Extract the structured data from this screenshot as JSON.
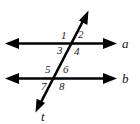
{
  "figure": {
    "type": "geometry-diagram",
    "background_color": "#ffffff",
    "stroke_color": "#000000",
    "text_color": "#1a1a1a"
  },
  "lines": [
    {
      "id": "line-a",
      "label": "a",
      "kind": "parallel-line",
      "label_x": 122,
      "label_y": 37,
      "x1": 6,
      "y1": 43,
      "x2": 116,
      "y2": 43,
      "arrow_start": true,
      "arrow_end": true
    },
    {
      "id": "line-b",
      "label": "b",
      "kind": "parallel-line",
      "label_x": 122,
      "label_y": 72,
      "x1": 6,
      "y1": 78,
      "x2": 116,
      "y2": 78,
      "arrow_start": true,
      "arrow_end": true
    },
    {
      "id": "line-t",
      "label": "t",
      "kind": "transversal",
      "label_x": 41,
      "label_y": 111,
      "x1": 88,
      "y1": 12,
      "x2": 36,
      "y2": 112,
      "arrow_start": true,
      "arrow_end": true
    }
  ],
  "intersections": [
    {
      "id": "intersection-a",
      "x": 73,
      "y": 43
    },
    {
      "id": "intersection-b",
      "x": 58,
      "y": 78
    }
  ],
  "angles": [
    {
      "id": "angle-1",
      "label": "1",
      "x": 61,
      "y": 30,
      "at": "intersection-a",
      "position": "upper-left"
    },
    {
      "id": "angle-2",
      "label": "2",
      "x": 78,
      "y": 29,
      "at": "intersection-a",
      "position": "upper-right"
    },
    {
      "id": "angle-3",
      "label": "3",
      "x": 57,
      "y": 45,
      "at": "intersection-a",
      "position": "lower-left"
    },
    {
      "id": "angle-4",
      "label": "4",
      "x": 74,
      "y": 46,
      "at": "intersection-a",
      "position": "lower-right"
    },
    {
      "id": "angle-5",
      "label": "5",
      "x": 45,
      "y": 64,
      "at": "intersection-b",
      "position": "upper-left"
    },
    {
      "id": "angle-6",
      "label": "6",
      "x": 63,
      "y": 64,
      "at": "intersection-b",
      "position": "upper-right"
    },
    {
      "id": "angle-7",
      "label": "7",
      "x": 41,
      "y": 81,
      "at": "intersection-b",
      "position": "lower-left"
    },
    {
      "id": "angle-8",
      "label": "8",
      "x": 59,
      "y": 81,
      "at": "intersection-b",
      "position": "lower-right"
    }
  ]
}
